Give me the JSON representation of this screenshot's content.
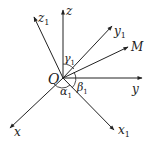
{
  "diagram": {
    "origin_label": "O",
    "axes": [
      {
        "id": "z",
        "label": "z"
      },
      {
        "id": "z1",
        "label": "z",
        "sub": "1"
      },
      {
        "id": "y1",
        "label": "y",
        "sub": "1"
      },
      {
        "id": "M",
        "label": "M"
      },
      {
        "id": "y",
        "label": "y"
      },
      {
        "id": "x1",
        "label": "x",
        "sub": "1"
      },
      {
        "id": "x",
        "label": "x"
      }
    ],
    "angles": [
      {
        "id": "gamma1",
        "label": "γ",
        "sub": "1"
      },
      {
        "id": "beta1",
        "label": "β",
        "sub": "1"
      },
      {
        "id": "alpha1",
        "label": "α",
        "sub": "1"
      }
    ]
  }
}
